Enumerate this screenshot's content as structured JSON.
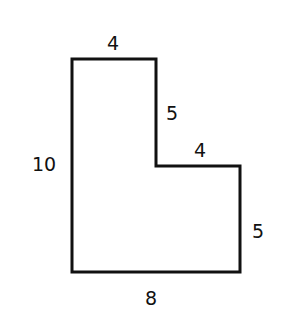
{
  "diagram": {
    "type": "L-shaped polygon with side lengths",
    "stroke_color": "#111111",
    "background": "#ffffff",
    "labels": {
      "top": "4",
      "inner_vertical": "5",
      "inner_horizontal": "4",
      "left": "10",
      "right": "5",
      "bottom": "8"
    },
    "sides": [
      {
        "side": "top",
        "length": 4
      },
      {
        "side": "inner_vertical",
        "length": 5
      },
      {
        "side": "inner_horizontal",
        "length": 4
      },
      {
        "side": "right",
        "length": 5
      },
      {
        "side": "bottom",
        "length": 8
      },
      {
        "side": "left",
        "length": 10
      }
    ]
  }
}
